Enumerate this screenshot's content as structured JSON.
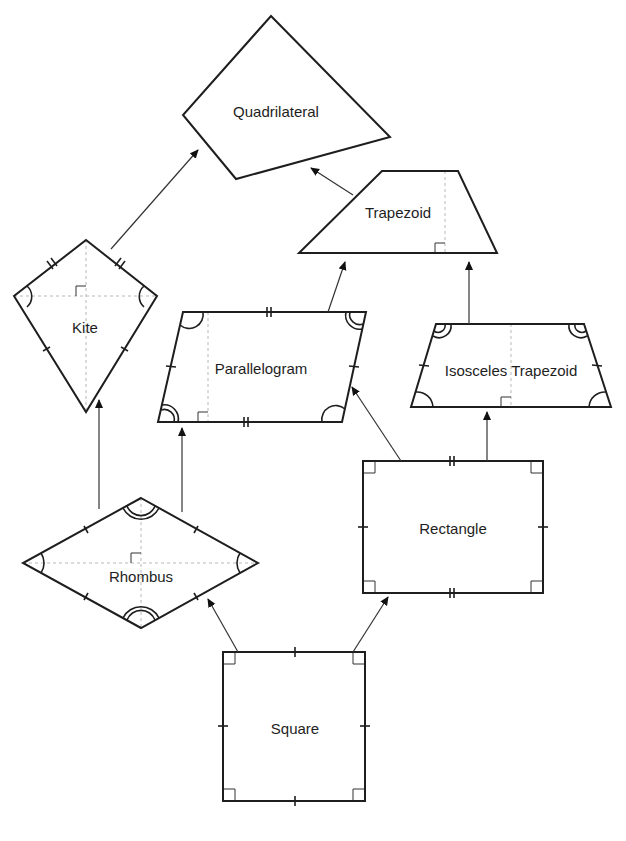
{
  "diagram": {
    "shapes": [
      {
        "id": "quadrilateral",
        "label": "Quadrilateral",
        "points": [
          [
            271,
            16
          ],
          [
            390,
            137
          ],
          [
            236,
            179
          ],
          [
            183,
            115
          ]
        ],
        "label_pos": [
          276,
          111
        ]
      },
      {
        "id": "trapezoid",
        "label": "Trapezoid",
        "points": [
          [
            382,
            171
          ],
          [
            458,
            171
          ],
          [
            497,
            253
          ],
          [
            299,
            253
          ]
        ],
        "label_pos": [
          398,
          212
        ]
      },
      {
        "id": "kite",
        "label": "Kite",
        "points": [
          [
            86,
            240
          ],
          [
            157,
            296
          ],
          [
            86,
            412
          ],
          [
            14,
            296
          ]
        ],
        "label_pos": [
          85,
          327
        ]
      },
      {
        "id": "parallelogram",
        "label": "Parallelogram",
        "points": [
          [
            183,
            312
          ],
          [
            366,
            312
          ],
          [
            342,
            422
          ],
          [
            158,
            422
          ]
        ],
        "label_pos": [
          261,
          368
        ]
      },
      {
        "id": "isosceles-trapezoid",
        "label": "Isosceles Trapezoid",
        "points": [
          [
            436,
            324
          ],
          [
            584,
            324
          ],
          [
            611,
            407
          ],
          [
            411,
            407
          ]
        ],
        "label_pos": [
          511,
          370
        ]
      },
      {
        "id": "rectangle",
        "label": "Rectangle",
        "points": [
          [
            363,
            461
          ],
          [
            543,
            461
          ],
          [
            543,
            593
          ],
          [
            363,
            593
          ]
        ],
        "label_pos": [
          453,
          528
        ]
      },
      {
        "id": "rhombus",
        "label": "Rhombus",
        "points": [
          [
            141,
            498
          ],
          [
            258,
            563
          ],
          [
            141,
            628
          ],
          [
            23,
            563
          ]
        ],
        "label_pos": [
          141,
          576
        ]
      },
      {
        "id": "square",
        "label": "Square",
        "points": [
          [
            223,
            652
          ],
          [
            365,
            652
          ],
          [
            365,
            801
          ],
          [
            223,
            801
          ]
        ],
        "label_pos": [
          295,
          728
        ]
      }
    ],
    "arrows": [
      {
        "from": "kite",
        "to": "quadrilateral",
        "start": [
          111,
          249
        ],
        "end": [
          198,
          150
        ]
      },
      {
        "from": "trapezoid",
        "to": "quadrilateral",
        "start": [
          353,
          195
        ],
        "end": [
          311,
          168
        ]
      },
      {
        "from": "parallelogram",
        "to": "trapezoid",
        "start": [
          328,
          312
        ],
        "end": [
          345,
          262
        ]
      },
      {
        "from": "isosceles-trapezoid",
        "to": "trapezoid",
        "start": [
          469,
          324
        ],
        "end": [
          469,
          262
        ]
      },
      {
        "from": "rhombus",
        "to": "kite",
        "start": [
          99,
          509
        ],
        "end": [
          99,
          400
        ]
      },
      {
        "from": "rhombus",
        "to": "parallelogram",
        "start": [
          182,
          512
        ],
        "end": [
          182,
          428
        ]
      },
      {
        "from": "rectangle",
        "to": "parallelogram",
        "start": [
          401,
          461
        ],
        "end": [
          352,
          387
        ]
      },
      {
        "from": "rectangle",
        "to": "isosceles-trapezoid",
        "start": [
          487,
          461
        ],
        "end": [
          487,
          412
        ]
      },
      {
        "from": "square",
        "to": "rhombus",
        "start": [
          238,
          652
        ],
        "end": [
          208,
          599
        ]
      },
      {
        "from": "square",
        "to": "rectangle",
        "start": [
          353,
          652
        ],
        "end": [
          388,
          597
        ]
      }
    ],
    "colors": {
      "stroke": "#1e1e1e",
      "arrow": "#333333",
      "guide": "#b8b8b8",
      "background": "#ffffff"
    }
  }
}
